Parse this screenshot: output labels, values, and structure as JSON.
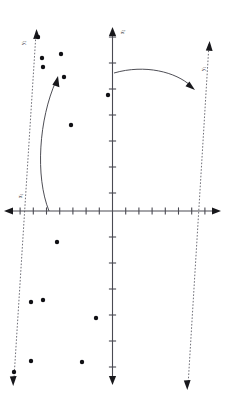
{
  "figure": {
    "type": "scatter-with-rotated-axes",
    "background": "#ffffff",
    "ink_color": "#2a2a30",
    "point_color": "#101014",
    "dashed_axis_color": "#55555f"
  },
  "axes": {
    "origin": {
      "x": 112.5,
      "y": 211.0
    },
    "horizontal": {
      "name": "x1-axis",
      "label": "x",
      "label_sub": "1",
      "label_pos": {
        "x": 22,
        "y": 196
      },
      "x_start": 6,
      "x_end": 219,
      "y": 211,
      "arrow_left": true,
      "arrow_right": true,
      "tick_spacing": 13.2,
      "tick_half": 3.6,
      "ticks_left": 8,
      "ticks_right": 8
    },
    "vertical": {
      "name": "x2-axis",
      "label": "x",
      "label_sub": "2",
      "label_pos": {
        "x": 122,
        "y": 30
      },
      "y_start": 27,
      "y_end": 384,
      "x": 112.5,
      "arrow_up": true,
      "arrow_down": true,
      "tick_spacing": 26.0,
      "tick_half": 3.6,
      "ticks_up": 7,
      "ticks_down": 6
    }
  },
  "rotated_axes": [
    {
      "name": "pc1-axis",
      "label": "y",
      "label_sub": "1",
      "label_pos": {
        "x": 203,
        "y": 67
      },
      "style": "dashed",
      "from": {
        "x": 190,
        "y": 383
      },
      "to": {
        "x": 209,
        "y": 44
      },
      "arrow_at": "both",
      "head_upper": {
        "x": 209,
        "y": 44
      },
      "head_lower": {
        "x": 187,
        "y": 389
      }
    },
    {
      "name": "pc2-axis",
      "label": "y",
      "label_sub": "2",
      "label_pos": {
        "x": 24,
        "y": 41
      },
      "style": "dashed",
      "from": {
        "x": 36,
        "y": 33
      },
      "to": {
        "x": 14,
        "y": 378
      },
      "arrow_at": "both",
      "head_upper": {
        "x": 37,
        "y": 31
      },
      "head_lower": {
        "x": 13,
        "y": 383
      }
    }
  ],
  "rotation_arcs": [
    {
      "name": "rotation-arc-vertical",
      "description": "curved arrow from vertical axis to pc1 axis",
      "path": "M 114 73 C 145 65, 175 72, 192 87",
      "arrowhead": {
        "x": 193,
        "y": 88,
        "angle": 42
      }
    },
    {
      "name": "rotation-arc-horizontal",
      "description": "curved arrow from horizontal axis to pc2 axis",
      "path": "M 49 210 C 36 175, 40 120, 57 80",
      "arrowhead": {
        "x": 58,
        "y": 78,
        "angle": -24
      }
    }
  ],
  "data_points": {
    "label": "observations",
    "radius": 2.2,
    "count": 14,
    "coords": [
      {
        "x": 38,
        "y": 37
      },
      {
        "x": 42,
        "y": 58
      },
      {
        "x": 61,
        "y": 54
      },
      {
        "x": 43,
        "y": 67
      },
      {
        "x": 64,
        "y": 77
      },
      {
        "x": 108,
        "y": 95
      },
      {
        "x": 71,
        "y": 125
      },
      {
        "x": 57,
        "y": 242
      },
      {
        "x": 43,
        "y": 300
      },
      {
        "x": 31,
        "y": 302
      },
      {
        "x": 96,
        "y": 318
      },
      {
        "x": 31,
        "y": 361
      },
      {
        "x": 82,
        "y": 362
      },
      {
        "x": 14,
        "y": 372
      }
    ]
  },
  "chart_data": {
    "type": "scatter",
    "title": "",
    "xlabel": "x1",
    "ylabel": "x2",
    "grid": false,
    "legend": "none",
    "series": [
      {
        "name": "observations",
        "x": [
          -5.6,
          -5.3,
          -3.9,
          -5.3,
          -3.7,
          0.0,
          -3.1,
          -4.2,
          -5.3,
          -6.2,
          -1.3,
          -6.2,
          -2.3,
          -7.5
        ],
        "y": [
          6.7,
          5.9,
          6.0,
          5.5,
          5.1,
          4.5,
          3.3,
          -1.2,
          -3.4,
          -3.5,
          -4.1,
          -5.8,
          -5.8,
          -6.2
        ]
      }
    ],
    "annotations": [
      {
        "text": "y1",
        "kind": "rotated-axis-label",
        "at": [
          7.3,
          5.5
        ]
      },
      {
        "text": "y2",
        "kind": "rotated-axis-label",
        "at": [
          -6.7,
          6.5
        ]
      },
      {
        "text": "x1",
        "kind": "axis-label",
        "at": [
          -6.8,
          0.6
        ]
      },
      {
        "text": "x2",
        "kind": "axis-label",
        "at": [
          0.4,
          7.0
        ]
      }
    ],
    "xlim": [
      -8.1,
      8.1
    ],
    "ylim": [
      -6.6,
      7.1
    ]
  }
}
